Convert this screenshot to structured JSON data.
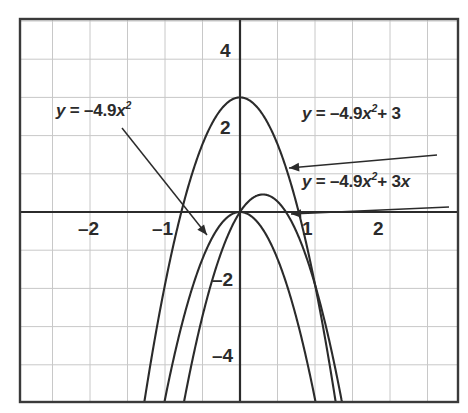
{
  "figure": {
    "name": "parabola-family-graph",
    "background_color": "#ffffff",
    "border_color": "#3a3a3a",
    "grid_color": "#c8c8c8",
    "axis_color": "#2b2b2b",
    "curve_color": "#2b2b2b",
    "annotation_color": "#2b2b2b"
  },
  "chart_data": {
    "type": "line",
    "title": "",
    "xlabel": "",
    "ylabel": "",
    "xlim": [
      -2.95,
      2.9
    ],
    "ylim": [
      -5.1,
      5.1
    ],
    "grid": true,
    "grid_x_step": 0.5,
    "grid_y_step": 1,
    "x_ticks": [
      -2,
      -1,
      1,
      2
    ],
    "x_tick_labels": [
      "–2",
      "–1",
      "1",
      "2"
    ],
    "y_ticks": [
      4,
      2,
      -2,
      -4
    ],
    "y_tick_labels": [
      "4",
      "2",
      "–2",
      "–4"
    ],
    "legend_position": "inline-annotations",
    "series": [
      {
        "name": "y = –4.9x²",
        "equation": "y = -4.9*x^2",
        "a": -4.9,
        "b": 0,
        "c": 0,
        "vertex": [
          0,
          0
        ],
        "x_intercepts": [
          0
        ],
        "y_intercept": 0
      },
      {
        "name": "y = –4.9x² + 3",
        "equation": "y = -4.9*x^2 + 3",
        "a": -4.9,
        "b": 0,
        "c": 3,
        "vertex": [
          0,
          3
        ],
        "x_intercepts": [
          -0.782,
          0.782
        ],
        "y_intercept": 3
      },
      {
        "name": "y = –4.9x² + 3x",
        "equation": "y = -4.9*x^2 + 3*x",
        "a": -4.9,
        "b": 3,
        "c": 0,
        "vertex": [
          0.306,
          0.459
        ],
        "x_intercepts": [
          0,
          0.612
        ],
        "y_intercept": 0
      }
    ]
  },
  "annotations": [
    {
      "id": "label-1",
      "name": "equation-label-neg49x2",
      "lhs": "y",
      "eq": "=",
      "rhs_prefix": "–4.9",
      "rhs_var": "x",
      "rhs_exp": "2",
      "rhs_suffix": "",
      "arrow_from": [
        122,
        128
      ],
      "arrow_to": [
        207,
        235
      ]
    },
    {
      "id": "label-2",
      "name": "equation-label-neg49x2-plus-3",
      "lhs": "y",
      "eq": "=",
      "rhs_prefix": "–4.9",
      "rhs_var": "x",
      "rhs_exp": "2",
      "rhs_suffix": "+ 3",
      "arrow_from": [
        437,
        155
      ],
      "arrow_to": [
        289,
        168
      ]
    },
    {
      "id": "label-3",
      "name": "equation-label-neg49x2-plus-3x",
      "lhs": "y",
      "eq": "=",
      "rhs_prefix": "–4.9",
      "rhs_var": "x",
      "rhs_exp": "2",
      "rhs_suffix": "+ 3x",
      "arrow_from": [
        449,
        207
      ],
      "arrow_to": [
        291,
        214
      ]
    }
  ],
  "tick_labels": {
    "x": [
      {
        "text": "–2",
        "left": 78,
        "top": 218
      },
      {
        "text": "–1",
        "left": 152,
        "top": 218
      },
      {
        "text": "1",
        "left": 302,
        "top": 218
      },
      {
        "text": "2",
        "left": 373,
        "top": 218
      }
    ],
    "y": [
      {
        "text": "4",
        "left": 220,
        "top": 40
      },
      {
        "text": "2",
        "left": 220,
        "top": 117
      },
      {
        "text": "–2",
        "left": 212,
        "top": 269
      },
      {
        "text": "–4",
        "left": 212,
        "top": 345
      }
    ]
  }
}
